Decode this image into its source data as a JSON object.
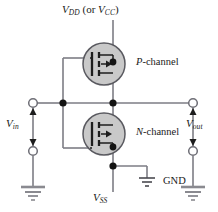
{
  "figure": {
    "type": "circuit-diagram"
  },
  "labels": {
    "supply_main": "V",
    "supply_main_sub": "DD",
    "supply_or": " (or ",
    "supply_alt": "V",
    "supply_alt_sub": "CC",
    "supply_close": ")",
    "p_channel_prefix": "P",
    "p_channel_suffix": "-channel",
    "n_channel_prefix": "N",
    "n_channel_suffix": "-channel",
    "vin_main": "V",
    "vin_sub": "in",
    "vout_main": "V",
    "vout_sub": "out",
    "gnd": "GND",
    "vss_main": "V",
    "vss_sub": "SS"
  },
  "colors": {
    "wire": "#7d7d85",
    "wire_dark": "#4a4a50",
    "device_fill": "#c9c9c9",
    "device_stroke": "#5a5a60",
    "node_dot": "#141414",
    "text": "#1a1a1a",
    "background": "#ffffff"
  },
  "nodes": {
    "supply_rail_x": 113,
    "mid_rail_y": 103,
    "input_terminal_x": 33,
    "output_terminal_x": 193,
    "gate_bus_x": 63,
    "pmos_center": [
      104,
      64
    ],
    "nmos_center": [
      104,
      134
    ],
    "ground_node_y": 166
  },
  "elements": {
    "supply_rail": "vdd-rail",
    "ground_symbol": "gnd-symbol",
    "input_arrow": "vin-arrow",
    "output_arrow": "vout-arrow",
    "pmos": "p-channel-mosfet",
    "nmos": "n-channel-mosfet"
  }
}
